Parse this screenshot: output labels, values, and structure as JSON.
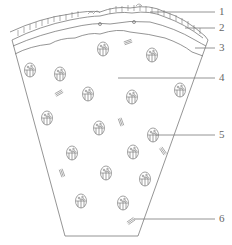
{
  "diagram": {
    "type": "cross-section schematic",
    "stroke_color": "#7a7a7a",
    "labels": [
      {
        "id": "1",
        "text": "1",
        "y": 12,
        "target_x": 150
      },
      {
        "id": "2",
        "text": "2",
        "y": 28,
        "target_x": 185
      },
      {
        "id": "3",
        "text": "3",
        "y": 48,
        "target_x": 195
      },
      {
        "id": "4",
        "text": "4",
        "y": 78,
        "target_x": 118
      },
      {
        "id": "5",
        "text": "5",
        "y": 135,
        "target_x": 156
      },
      {
        "id": "6",
        "text": "6",
        "y": 219,
        "target_x": 134
      }
    ],
    "cells": [
      {
        "x": 30,
        "y": 70
      },
      {
        "x": 60,
        "y": 74
      },
      {
        "x": 103,
        "y": 49
      },
      {
        "x": 152,
        "y": 55
      },
      {
        "x": 88,
        "y": 94
      },
      {
        "x": 132,
        "y": 97
      },
      {
        "x": 180,
        "y": 90
      },
      {
        "x": 47,
        "y": 118
      },
      {
        "x": 99,
        "y": 128
      },
      {
        "x": 153,
        "y": 135
      },
      {
        "x": 133,
        "y": 152
      },
      {
        "x": 72,
        "y": 153
      },
      {
        "x": 106,
        "y": 173
      },
      {
        "x": 145,
        "y": 179
      },
      {
        "x": 81,
        "y": 201
      },
      {
        "x": 123,
        "y": 203
      }
    ],
    "hatches": [
      {
        "x": 128,
        "y": 42,
        "angle": -20
      },
      {
        "x": 59,
        "y": 93,
        "angle": -30
      },
      {
        "x": 121,
        "y": 122,
        "angle": 70
      },
      {
        "x": 62,
        "y": 173,
        "angle": 70
      },
      {
        "x": 163,
        "y": 151,
        "angle": 55
      },
      {
        "x": 131,
        "y": 221,
        "angle": -35
      }
    ]
  }
}
